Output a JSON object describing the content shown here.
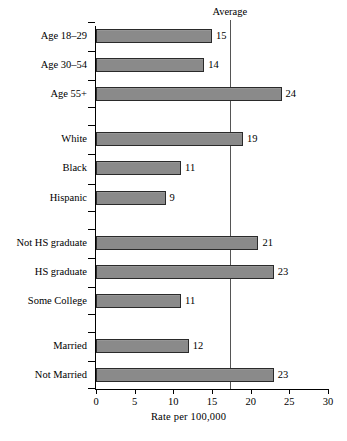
{
  "chart_data": {
    "type": "bar",
    "orientation": "horizontal",
    "title": "",
    "xlabel": "Rate per 100,000",
    "ylabel": "",
    "xlim": [
      0,
      30
    ],
    "xticks": [
      0,
      5,
      10,
      15,
      20,
      25,
      30
    ],
    "xticklabels": [
      "0",
      "5",
      "10",
      "15",
      "20",
      "25",
      "30"
    ],
    "grid": false,
    "legend": false,
    "categories": [
      "Age 18–29",
      "Age 30–54",
      "Age 55+",
      "White",
      "Black",
      "Hispanic",
      "Not HS graduate",
      "HS graduate",
      "Some College",
      "Married",
      "Not Married"
    ],
    "values": [
      15,
      14,
      24,
      19,
      11,
      9,
      21,
      23,
      11,
      12,
      23
    ],
    "value_labels": [
      "15",
      "14",
      "24",
      "19",
      "11",
      "9",
      "21",
      "23",
      "11",
      "12",
      "23"
    ],
    "groups": [
      {
        "name": "Age",
        "categories": [
          "Age 18–29",
          "Age 30–54",
          "Age 55+"
        ]
      },
      {
        "name": "Race/Ethnicity",
        "categories": [
          "White",
          "Black",
          "Hispanic"
        ]
      },
      {
        "name": "Education",
        "categories": [
          "Not HS graduate",
          "HS graduate",
          "Some College"
        ]
      },
      {
        "name": "Marital status",
        "categories": [
          "Married",
          "Not Married"
        ]
      }
    ],
    "annotations": [
      {
        "name": "average-line",
        "label": "Average",
        "value": 17.3,
        "orientation": "vertical"
      }
    ],
    "colors": {
      "bar_fill": "#8a8a8a",
      "bar_edge": "#2a2a2a",
      "average_line": "#555555",
      "axis": "#000000",
      "background": "#ffffff"
    }
  }
}
